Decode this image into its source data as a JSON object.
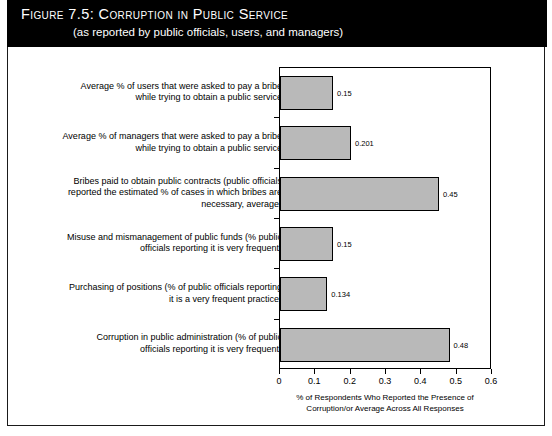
{
  "figure": {
    "title": "Figure 7.5:  Corruption in Public Service",
    "subtitle": "(as reported by public officials, users, and managers)"
  },
  "chart_data": {
    "type": "bar",
    "orientation": "horizontal",
    "title": "Corruption in Public Service",
    "subtitle": "(as reported by public officials, users, and managers)",
    "xlabel": "% of Respondents Who Reported the Presence of Corruption/or Average Across All Responses",
    "xlabel_lines": [
      "% of  Respondents Who Reported the Presence of",
      "Corruption/or Average Across All Responses"
    ],
    "ylabel": "",
    "xlim": [
      0,
      0.6
    ],
    "xticks": [
      0,
      0.1,
      0.2,
      0.3,
      0.4,
      0.5,
      0.6
    ],
    "xticklabels": [
      "0",
      "0.1",
      "0.2",
      "0.3",
      "0.4",
      "0.5",
      "0.6"
    ],
    "grid": false,
    "legend": false,
    "bar_color": "#b9b9b9",
    "bar_edge_color": "#000000",
    "categories": [
      "Average %  of users that were asked to pay a bribe while trying to obtain a public service",
      "Average %  of managers that were asked to pay a bribe while trying to obtain a public service",
      "Bribes paid to  obtain public contracts (public officials reported the estimated % of cases in which bribes are necessary, average)",
      "Misuse and mismanagement of public funds (% public officials reporting it is very frequent)",
      "Purchasing of positions (% of public officials reporting it is a very frequent practice)",
      "Corruption in public administration (% of public officials reporting it is very frequent)"
    ],
    "category_lines": [
      [
        "Average %  of users that were asked to pay a bribe",
        "while trying to obtain a public service"
      ],
      [
        "Average %  of managers that were asked to pay a bribe",
        "while trying to obtain a public service"
      ],
      [
        "Bribes paid to  obtain public contracts (public officials",
        "reported the estimated % of cases in which bribes are",
        "necessary, average)"
      ],
      [
        "Misuse and mismanagement of public funds (% public",
        "officials reporting it is very frequent)"
      ],
      [
        "Purchasing of positions (% of public officials reporting",
        "it is a very frequent practice)"
      ],
      [
        "Corruption in public administration (% of public",
        "officials reporting it is very frequent)"
      ]
    ],
    "values": [
      0.15,
      0.201,
      0.45,
      0.15,
      0.134,
      0.48
    ],
    "value_labels": [
      "0.15",
      "0.201",
      "0.45",
      "0.15",
      "0.134",
      "0.48"
    ]
  }
}
